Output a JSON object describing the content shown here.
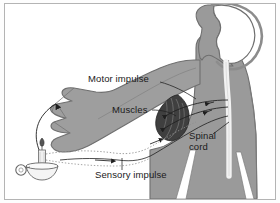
{
  "figure": {
    "background_color": "#ffffff",
    "frame_color": "#b4b4b4"
  },
  "colors": {
    "body_fill": "#9a9a9a",
    "body_outline": "#6f6f6f",
    "arm_fill": "#9e9e9e",
    "spinal_cord_fill": "#f2f2f2",
    "brain_fill": "#ffffff",
    "muscle_dark": "#3a3a3a",
    "nerve_line": "#1f1f1f",
    "sensory_dotted": "#808080",
    "candle_line": "#555555",
    "text": "#1a1a1a"
  },
  "labels": [
    {
      "id": "motor-impulse",
      "text": "Motor impulse",
      "x": 88,
      "y": 79
    },
    {
      "id": "muscles",
      "text": "Muscles",
      "x": 112,
      "y": 110
    },
    {
      "id": "spinal-cord-line1",
      "text": "Spinal",
      "x": 189,
      "y": 137
    },
    {
      "id": "spinal-cord-line2",
      "text": "cord",
      "x": 189,
      "y": 148
    },
    {
      "id": "sensory-impulse",
      "text": "Sensory impulse",
      "x": 95,
      "y": 176
    }
  ],
  "elements": {
    "brain": "brain-outline",
    "head": "head-profile-silhouette",
    "torso": "torso-silhouette",
    "legs": "legs-silhouette",
    "arm": "outstretched-arm",
    "hand": "pointing-hand",
    "muscle": "biceps-muscle",
    "spinal_cord": "spinal-cord-channel",
    "candle": "candle-in-holder",
    "flame": "candle-flame",
    "motor_nerves": "motor-nerve-pathway",
    "sensory_nerve": "sensory-nerve-pathway",
    "pain_arrow": "pain-stimulus-arrow"
  }
}
